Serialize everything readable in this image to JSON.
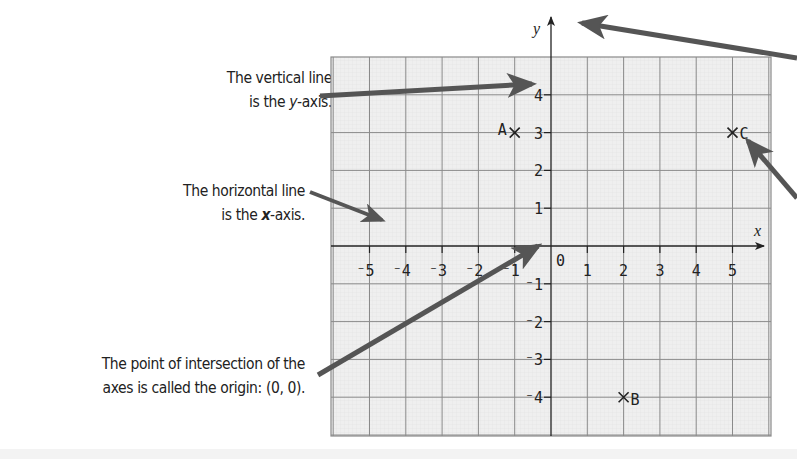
{
  "annotations": {
    "y_axis": {
      "line1": "The vertical line",
      "line2_pre": "is the ",
      "line2_var": "y",
      "line2_post": "-axis."
    },
    "x_axis": {
      "line1": "The horizontal line",
      "line2_pre": "is the ",
      "line2_var": "x",
      "line2_post": "-axis."
    },
    "origin": {
      "line1": "The point of intersection of the",
      "line2": "axes is called the origin: (0, 0)."
    }
  },
  "axes": {
    "x_label": "x",
    "y_label": "y",
    "origin_label": "0",
    "x_ticks": [
      "⁻5",
      "⁻4",
      "⁻3",
      "⁻2",
      "⁻1",
      "1",
      "2",
      "3",
      "4",
      "5"
    ],
    "y_ticks": [
      "4",
      "3",
      "2",
      "1",
      "⁻1",
      "⁻2",
      "⁻3",
      "⁻4"
    ]
  },
  "points": [
    {
      "label": "A",
      "x": -1,
      "y": 3
    },
    {
      "label": "B",
      "x": 2,
      "y": -4
    },
    {
      "label": "C",
      "x": 5,
      "y": 3
    }
  ],
  "colors": {
    "grid_fill": "#ececec",
    "grid_line": "#8a8a8a",
    "axis": "#222222",
    "arrow": "#555555",
    "text": "#222222"
  }
}
